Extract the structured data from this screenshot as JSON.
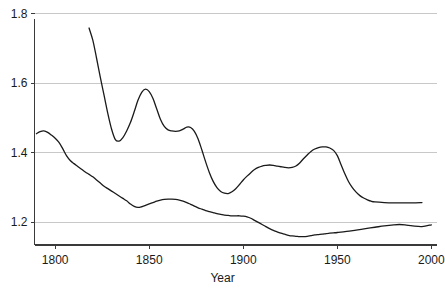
{
  "chart_data": {
    "type": "line",
    "title": "",
    "subtitle": "",
    "xlabel": "Year",
    "ylabel": "",
    "xlim": [
      1789,
      2003
    ],
    "ylim": [
      1.135,
      1.805
    ],
    "xticks": [
      1800,
      1850,
      1900,
      1950,
      2000
    ],
    "xtick_labels": [
      "1800",
      "1850",
      "1900",
      "1950",
      "2000"
    ],
    "yticks": [
      1.2,
      1.4,
      1.6,
      1.8
    ],
    "ytick_labels": [
      "1.2",
      "1.4",
      "1.6",
      "1.8"
    ],
    "grid": "horizontal",
    "grid_color": "#c8c8c8",
    "legend": "none",
    "line_color": "#1a1a1a",
    "line_width": 1.3,
    "axis_color": "#3a3a3a",
    "background": "#ffffff",
    "series": [
      {
        "name": "upper-curve",
        "x": [
          1818,
          1820,
          1822,
          1824,
          1826,
          1828,
          1830,
          1832,
          1834,
          1836,
          1838,
          1840,
          1842,
          1844,
          1846,
          1848,
          1850,
          1852,
          1854,
          1856,
          1858,
          1860,
          1862,
          1864,
          1866,
          1868,
          1870,
          1872,
          1874,
          1876,
          1878,
          1880,
          1882,
          1884,
          1886,
          1888,
          1890,
          1892,
          1894,
          1896,
          1898,
          1900,
          1902,
          1904,
          1906,
          1908,
          1910,
          1912,
          1914,
          1916,
          1918,
          1920,
          1922,
          1924,
          1926,
          1928,
          1930,
          1932,
          1934,
          1936,
          1938,
          1940,
          1942,
          1944,
          1946,
          1948,
          1950,
          1952,
          1954,
          1956,
          1958,
          1960,
          1962,
          1964,
          1966,
          1968,
          1970,
          1975,
          1980,
          1985,
          1990,
          1995
        ],
        "values": [
          1.759,
          1.724,
          1.672,
          1.617,
          1.565,
          1.513,
          1.468,
          1.438,
          1.434,
          1.444,
          1.463,
          1.487,
          1.518,
          1.551,
          1.574,
          1.583,
          1.576,
          1.556,
          1.526,
          1.496,
          1.476,
          1.466,
          1.463,
          1.462,
          1.463,
          1.468,
          1.474,
          1.473,
          1.462,
          1.44,
          1.408,
          1.374,
          1.343,
          1.318,
          1.3,
          1.289,
          1.284,
          1.283,
          1.288,
          1.297,
          1.309,
          1.322,
          1.333,
          1.343,
          1.352,
          1.358,
          1.362,
          1.364,
          1.365,
          1.364,
          1.362,
          1.36,
          1.358,
          1.357,
          1.358,
          1.362,
          1.371,
          1.383,
          1.394,
          1.404,
          1.411,
          1.415,
          1.417,
          1.417,
          1.414,
          1.407,
          1.392,
          1.366,
          1.34,
          1.317,
          1.3,
          1.287,
          1.277,
          1.27,
          1.265,
          1.261,
          1.259,
          1.257,
          1.256,
          1.256,
          1.256,
          1.257
        ]
      },
      {
        "name": "lower-curve",
        "x": [
          1790,
          1792,
          1794,
          1796,
          1798,
          1800,
          1802,
          1804,
          1806,
          1808,
          1810,
          1812,
          1814,
          1816,
          1818,
          1820,
          1822,
          1824,
          1826,
          1828,
          1830,
          1832,
          1834,
          1836,
          1838,
          1840,
          1842,
          1844,
          1846,
          1848,
          1850,
          1852,
          1854,
          1856,
          1858,
          1860,
          1862,
          1864,
          1866,
          1868,
          1870,
          1872,
          1874,
          1876,
          1878,
          1880,
          1882,
          1884,
          1886,
          1888,
          1890,
          1892,
          1894,
          1896,
          1898,
          1900,
          1902,
          1904,
          1906,
          1908,
          1910,
          1912,
          1914,
          1916,
          1918,
          1920,
          1922,
          1924,
          1926,
          1928,
          1930,
          1932,
          1934,
          1936,
          1938,
          1940,
          1942,
          1944,
          1946,
          1948,
          1950,
          1955,
          1960,
          1965,
          1970,
          1975,
          1980,
          1983,
          1986,
          1990,
          1995,
          2000
        ],
        "values": [
          1.455,
          1.461,
          1.463,
          1.459,
          1.451,
          1.442,
          1.43,
          1.412,
          1.392,
          1.378,
          1.369,
          1.361,
          1.353,
          1.345,
          1.338,
          1.331,
          1.322,
          1.313,
          1.304,
          1.297,
          1.29,
          1.283,
          1.276,
          1.269,
          1.262,
          1.253,
          1.246,
          1.243,
          1.245,
          1.249,
          1.253,
          1.257,
          1.261,
          1.264,
          1.266,
          1.267,
          1.267,
          1.266,
          1.264,
          1.261,
          1.257,
          1.252,
          1.247,
          1.242,
          1.238,
          1.234,
          1.231,
          1.228,
          1.225,
          1.223,
          1.221,
          1.22,
          1.219,
          1.219,
          1.219,
          1.218,
          1.216,
          1.212,
          1.206,
          1.2,
          1.194,
          1.188,
          1.182,
          1.177,
          1.173,
          1.169,
          1.166,
          1.163,
          1.161,
          1.16,
          1.159,
          1.159,
          1.16,
          1.162,
          1.164,
          1.165,
          1.166,
          1.168,
          1.169,
          1.17,
          1.171,
          1.174,
          1.178,
          1.182,
          1.186,
          1.19,
          1.193,
          1.194,
          1.193,
          1.19,
          1.188,
          1.193
        ]
      }
    ]
  }
}
